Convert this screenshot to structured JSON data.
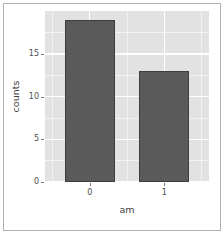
{
  "chart_data": {
    "type": "bar",
    "title": "",
    "xlabel": "am",
    "ylabel": "counts",
    "categories": [
      "0",
      "1"
    ],
    "values": [
      19,
      13
    ],
    "series": [
      {
        "name": "counts",
        "values": [
          19,
          13
        ]
      }
    ],
    "x_tick_labels": [
      "0",
      "1"
    ],
    "y_tick_labels": [
      "0",
      "5",
      "10",
      "15"
    ],
    "y_ticks": [
      0,
      5,
      10,
      15
    ],
    "y_minor_ticks": [
      2.5,
      7.5,
      12.5,
      17.5
    ],
    "ylim": [
      0,
      20.05
    ],
    "xlim": [
      0.4,
      2.6
    ],
    "grid": true,
    "legend": "none",
    "bar_color": "#5a5a5a",
    "bar_border_color": "#3d3d3d",
    "panel_background": "#e2e2e2",
    "gridline_color": "#ffffff",
    "axis_text_color": "#4d4d4d",
    "frame_border_color": "#b0b0b0"
  },
  "figure": {
    "axis_title_x": "am",
    "axis_title_y": "counts"
  }
}
